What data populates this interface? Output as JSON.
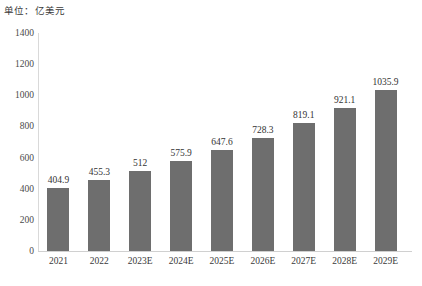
{
  "unit_caption": "单位：亿美元",
  "chart_data": {
    "type": "bar",
    "title": "",
    "subtitle": "",
    "xlabel": "",
    "ylabel": "",
    "unit_note": "单位：亿美元",
    "categories": [
      "2021",
      "2022",
      "2023E",
      "2024E",
      "2025E",
      "2026E",
      "2027E",
      "2028E",
      "2029E"
    ],
    "values": [
      404.9,
      455.3,
      512,
      575.9,
      647.6,
      728.3,
      819.1,
      921.1,
      1035.9
    ],
    "value_labels": [
      "404.9",
      "455.3",
      "512",
      "575.9",
      "647.6",
      "728.3",
      "819.1",
      "921.1",
      "1035.9"
    ],
    "ylim": [
      0,
      1400
    ],
    "y_ticks": [
      0,
      200,
      400,
      600,
      800,
      1000,
      1200,
      1400
    ],
    "y_tick_labels": [
      "0",
      "200",
      "400",
      "600",
      "800",
      "1000",
      "1200",
      "1400"
    ],
    "grid": false,
    "legend": null,
    "bar_color": "#6e6e6e",
    "axis_color": "#d0d0d0",
    "text_color": "#333333"
  }
}
